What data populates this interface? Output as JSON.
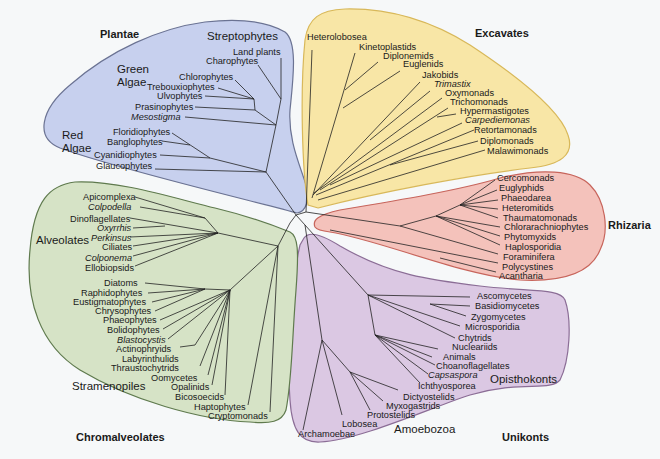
{
  "colors": {
    "background": "#f6f8f9",
    "plantae_fill": "#c7d0ee",
    "plantae_stroke": "#6b7393",
    "excavates_fill": "#f8e6a6",
    "excavates_stroke": "#d8b85a",
    "rhizaria_fill": "#f4c2bb",
    "rhizaria_stroke": "#c7655c",
    "unikonts_fill": "#dbc8e3",
    "unikonts_stroke": "#8b6d96",
    "chromalveolates_fill": "#d6e3c6",
    "chromalveolates_stroke": "#5f7a4e",
    "branch": "#222222"
  },
  "supergroups": {
    "plantae": "Plantae",
    "excavates": "Excavates",
    "rhizaria": "Rhizaria",
    "unikonts": "Unikonts",
    "chromalveolates": "Chromalveolates"
  },
  "subgroups": {
    "streptophytes": "Streptophytes",
    "green_algae_1": "Green",
    "green_algae_2": "Algae",
    "red_algae_1": "Red",
    "red_algae_2": "Algae",
    "alveolates": "Alveolates",
    "stramenopiles": "Stramenopiles",
    "opisthokonts": "Opisthokonts",
    "amoebozoa": "Amoebozoa"
  },
  "plantae_taxa": [
    {
      "name": "Land plants",
      "italic": false
    },
    {
      "name": "Charophytes",
      "italic": false
    },
    {
      "name": "Chlorophytes",
      "italic": false
    },
    {
      "name": "Trebouxiophytes",
      "italic": false
    },
    {
      "name": "Ulvophytes",
      "italic": false
    },
    {
      "name": "Prasinophytes",
      "italic": false
    },
    {
      "name": "Mesostigma",
      "italic": true
    },
    {
      "name": "Floridiophytes",
      "italic": false
    },
    {
      "name": "Banglophytes",
      "italic": false
    },
    {
      "name": "Cyanidiophytes",
      "italic": false
    },
    {
      "name": "Glaucophytes",
      "italic": false
    }
  ],
  "excavates_taxa": [
    {
      "name": "Heterolobosea",
      "italic": false
    },
    {
      "name": "Kinetoplastids",
      "italic": false
    },
    {
      "name": "Diplonemids",
      "italic": false
    },
    {
      "name": "Euglenids",
      "italic": false
    },
    {
      "name": "Jakobids",
      "italic": false
    },
    {
      "name": "Trimastix",
      "italic": true
    },
    {
      "name": "Oxymonads",
      "italic": false
    },
    {
      "name": "Trichomonads",
      "italic": false
    },
    {
      "name": "Hypermastigotes",
      "italic": false
    },
    {
      "name": "Carpediemonas",
      "italic": true
    },
    {
      "name": "Retortamonads",
      "italic": false
    },
    {
      "name": "Diplomonads",
      "italic": false
    },
    {
      "name": "Malawimonads",
      "italic": false
    }
  ],
  "rhizaria_taxa": [
    {
      "name": "Cercomonads",
      "italic": false
    },
    {
      "name": "Euglyphids",
      "italic": false
    },
    {
      "name": "Phaeodarea",
      "italic": false
    },
    {
      "name": "Heteromitids",
      "italic": false
    },
    {
      "name": "Thaumatomonads",
      "italic": false
    },
    {
      "name": "Chlorarachniophytes",
      "italic": false
    },
    {
      "name": "Phytomyxids",
      "italic": false
    },
    {
      "name": "Haplosporidia",
      "italic": false
    },
    {
      "name": "Foraminifera",
      "italic": false
    },
    {
      "name": "Polycystines",
      "italic": false
    },
    {
      "name": "Acantharia",
      "italic": false
    }
  ],
  "unikonts_taxa": [
    {
      "name": "Ascomycetes",
      "italic": false
    },
    {
      "name": "Basidiomycetes",
      "italic": false
    },
    {
      "name": "Zygomycetes",
      "italic": false
    },
    {
      "name": "Microsporidia",
      "italic": false
    },
    {
      "name": "Chytrids",
      "italic": false
    },
    {
      "name": "Nucleariids",
      "italic": false
    },
    {
      "name": "Animals",
      "italic": false
    },
    {
      "name": "Choanoflagellates",
      "italic": false
    },
    {
      "name": "Capsaspora",
      "italic": true
    },
    {
      "name": "Ichthyosporea",
      "italic": false
    },
    {
      "name": "Dictyostelids",
      "italic": false
    },
    {
      "name": "Myxogastrids",
      "italic": false
    },
    {
      "name": "Protostelids",
      "italic": false
    },
    {
      "name": "Lobosea",
      "italic": false
    },
    {
      "name": "Archamoebae",
      "italic": false
    }
  ],
  "chromalveolates_taxa": [
    {
      "name": "Apicomplexa",
      "italic": false
    },
    {
      "name": "Colpodella",
      "italic": true
    },
    {
      "name": "Dinoflagellates",
      "italic": false
    },
    {
      "name": "Oxyrrhis",
      "italic": true
    },
    {
      "name": "Perkinsus",
      "italic": true
    },
    {
      "name": "Ciliates",
      "italic": false
    },
    {
      "name": "Colponema",
      "italic": true
    },
    {
      "name": "Ellobiopsids",
      "italic": false
    },
    {
      "name": "Diatoms",
      "italic": false
    },
    {
      "name": "Raphidophytes",
      "italic": false
    },
    {
      "name": "Eustigmatophytes",
      "italic": false
    },
    {
      "name": "Chrysophytes",
      "italic": false
    },
    {
      "name": "Phaeophytes",
      "italic": false
    },
    {
      "name": "Bolidophytes",
      "italic": false
    },
    {
      "name": "Blastocystis",
      "italic": true
    },
    {
      "name": "Actinophryids",
      "italic": false
    },
    {
      "name": "Labyrinthulids",
      "italic": false
    },
    {
      "name": "Thraustochytrids",
      "italic": false
    },
    {
      "name": "Oomycetes",
      "italic": false
    },
    {
      "name": "Opalinids",
      "italic": false
    },
    {
      "name": "Bicosoecids",
      "italic": false
    },
    {
      "name": "Haptophytes",
      "italic": false
    },
    {
      "name": "Cryptomonads",
      "italic": false
    }
  ]
}
